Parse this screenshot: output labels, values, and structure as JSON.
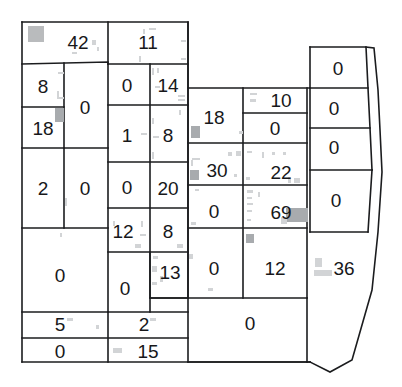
{
  "map": {
    "title": "parcel-value-map",
    "stroke_color": "#1b1c1e",
    "label_color": "#17181a",
    "background_color": "#ffffff",
    "noise_color": "#b9bbbd",
    "width": 402,
    "height": 387,
    "parcels": [
      {
        "id": "p01",
        "value": "42",
        "x": 78,
        "y": 42
      },
      {
        "id": "p02",
        "value": "11",
        "x": 148,
        "y": 42
      },
      {
        "id": "p03",
        "value": "8",
        "x": 43,
        "y": 86
      },
      {
        "id": "p04",
        "value": "0",
        "x": 85,
        "y": 107
      },
      {
        "id": "p05",
        "value": "0",
        "x": 127,
        "y": 85
      },
      {
        "id": "p06",
        "value": "14",
        "x": 168,
        "y": 85
      },
      {
        "id": "p07",
        "value": "18",
        "x": 43,
        "y": 128
      },
      {
        "id": "p08",
        "value": "1",
        "x": 127,
        "y": 135
      },
      {
        "id": "p09",
        "value": "8",
        "x": 168,
        "y": 135
      },
      {
        "id": "p10",
        "value": "18",
        "x": 214,
        "y": 117
      },
      {
        "id": "p11",
        "value": "10",
        "x": 281,
        "y": 100
      },
      {
        "id": "p12",
        "value": "0",
        "x": 275,
        "y": 128
      },
      {
        "id": "p13",
        "value": "2",
        "x": 43,
        "y": 188
      },
      {
        "id": "p14",
        "value": "0",
        "x": 85,
        "y": 188
      },
      {
        "id": "p15",
        "value": "0",
        "x": 127,
        "y": 187
      },
      {
        "id": "p16",
        "value": "20",
        "x": 168,
        "y": 188
      },
      {
        "id": "p17",
        "value": "30",
        "x": 217,
        "y": 170
      },
      {
        "id": "p18",
        "value": "22",
        "x": 281,
        "y": 172
      },
      {
        "id": "p19",
        "value": "0",
        "x": 214,
        "y": 211
      },
      {
        "id": "p20",
        "value": "69",
        "x": 281,
        "y": 212
      },
      {
        "id": "p21",
        "value": "12",
        "x": 123,
        "y": 231
      },
      {
        "id": "p22",
        "value": "8",
        "x": 168,
        "y": 231
      },
      {
        "id": "p23",
        "value": "0",
        "x": 60,
        "y": 275
      },
      {
        "id": "p24",
        "value": "0",
        "x": 125,
        "y": 288
      },
      {
        "id": "p25",
        "value": "13",
        "x": 170,
        "y": 272
      },
      {
        "id": "p26",
        "value": "0",
        "x": 214,
        "y": 268
      },
      {
        "id": "p27",
        "value": "12",
        "x": 275,
        "y": 268
      },
      {
        "id": "p28",
        "value": "5",
        "x": 60,
        "y": 324
      },
      {
        "id": "p29",
        "value": "2",
        "x": 144,
        "y": 324
      },
      {
        "id": "p30",
        "value": "0",
        "x": 60,
        "y": 351
      },
      {
        "id": "p31",
        "value": "15",
        "x": 148,
        "y": 351
      },
      {
        "id": "p32",
        "value": "0",
        "x": 250,
        "y": 323
      },
      {
        "id": "p33",
        "value": "0",
        "x": 338,
        "y": 68
      },
      {
        "id": "p34",
        "value": "0",
        "x": 334,
        "y": 108
      },
      {
        "id": "p35",
        "value": "0",
        "x": 334,
        "y": 147
      },
      {
        "id": "p36",
        "value": "0",
        "x": 336,
        "y": 200
      },
      {
        "id": "p37",
        "value": "36",
        "x": 344,
        "y": 268
      }
    ]
  }
}
